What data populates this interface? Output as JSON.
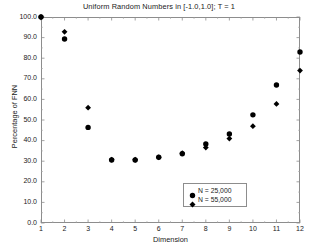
{
  "chart_data": {
    "type": "scatter",
    "title": "Uniform Random Numbers in [-1.0,1.0]; T = 1",
    "xlabel": "Dimension",
    "ylabel": "Percentage of FNN",
    "xlim": [
      1,
      12
    ],
    "ylim": [
      0.0,
      100.0
    ],
    "grid": false,
    "legend_position": "lower-right-inside",
    "xticks": [
      "1",
      "2",
      "3",
      "4",
      "5",
      "6",
      "7",
      "8",
      "9",
      "10",
      "11",
      "12"
    ],
    "xtick_values": [
      1,
      2,
      3,
      4,
      5,
      6,
      7,
      8,
      9,
      10,
      11,
      12
    ],
    "yticks": [
      "0.0",
      "10.0",
      "20.0",
      "30.0",
      "40.0",
      "50.0",
      "60.0",
      "70.0",
      "80.0",
      "90.0",
      "100.0"
    ],
    "ytick_values": [
      0,
      10,
      20,
      30,
      40,
      50,
      60,
      70,
      80,
      90,
      100
    ],
    "series": [
      {
        "name": "N = 25,000",
        "marker": "circle",
        "color": "#000000",
        "x": [
          1,
          2,
          3,
          4,
          5,
          6,
          7,
          8,
          9,
          10,
          11,
          12
        ],
        "values": [
          100.0,
          89.3,
          46.4,
          30.6,
          30.6,
          31.9,
          33.6,
          38.4,
          43.2,
          52.5,
          67.0,
          83.0
        ]
      },
      {
        "name": "N = 55,000",
        "marker": "diamond",
        "color": "#000000",
        "x": [
          1,
          2,
          3,
          4,
          5,
          6,
          7,
          8,
          9,
          10,
          11,
          12
        ],
        "values": [
          100.0,
          92.8,
          56.0,
          30.8,
          30.7,
          31.9,
          33.9,
          36.6,
          41.0,
          47.0,
          57.8,
          74.0
        ]
      }
    ]
  },
  "legend": {
    "entries": [
      {
        "label": "N = 25,000",
        "marker": "circle"
      },
      {
        "label": "N = 55,000",
        "marker": "diamond"
      }
    ]
  }
}
